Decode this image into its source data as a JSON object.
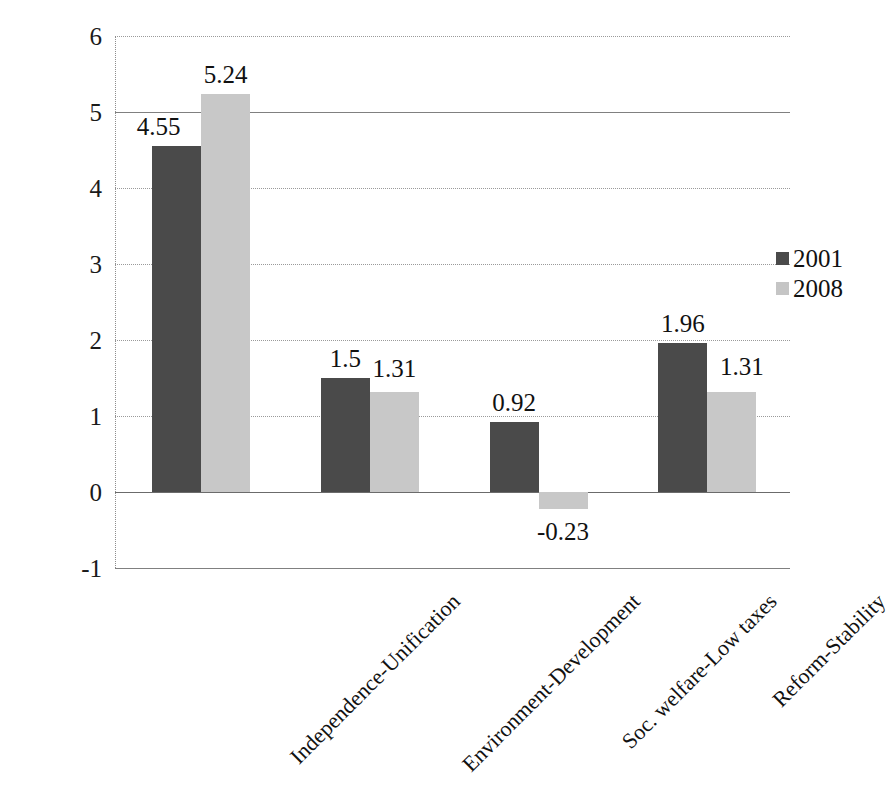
{
  "chart_data": {
    "type": "bar",
    "title": "",
    "subtitle": "",
    "xlabel": "",
    "ylabel": "",
    "ylim": [
      -1,
      6
    ],
    "ytick_labels": [
      "6",
      "5",
      "4",
      "3",
      "2",
      "1",
      "0",
      "-1"
    ],
    "yticks": [
      6,
      5,
      4,
      3,
      2,
      1,
      0,
      -1
    ],
    "grid": true,
    "legend_position": "right",
    "categories": [
      "Independence-Unification",
      "Environment-Development",
      "Soc. welfare-Low taxes",
      "Reform-Stability"
    ],
    "series": [
      {
        "name": "2001",
        "color": "#4a4a4a",
        "values": [
          4.55,
          1.5,
          0.92,
          1.96
        ],
        "labels": [
          "4.55",
          "1.5",
          "0.92",
          "1.96"
        ]
      },
      {
        "name": "2008",
        "color": "#c8c8c8",
        "values": [
          5.24,
          1.31,
          -0.23,
          1.31
        ],
        "labels": [
          "5.24",
          "1.31",
          "-0.23",
          "1.31"
        ]
      }
    ]
  },
  "legend": {
    "items": [
      {
        "label": "2001",
        "color": "#4a4a4a"
      },
      {
        "label": "2008",
        "color": "#c5c5c5"
      }
    ]
  }
}
